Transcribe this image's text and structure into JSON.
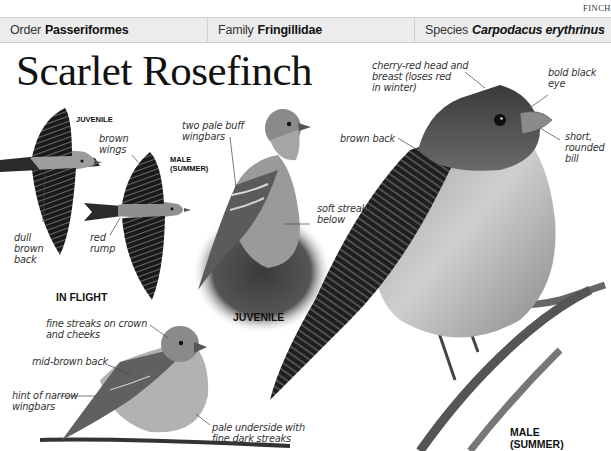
{
  "page": {
    "section_tag": "FINCH",
    "title": "Scarlet Rosefinch"
  },
  "taxonomy": {
    "order": {
      "label": "Order",
      "value": "Passeriformes"
    },
    "family": {
      "label": "Family",
      "value": "Fringillidae"
    },
    "species": {
      "label": "Species",
      "value": "Carpodacus erythrinus"
    }
  },
  "in_flight": {
    "caption": "IN FLIGHT",
    "juvenile_label": "JUVENILE",
    "male_label": "MALE\n(SUMMER)",
    "annotations": {
      "brown_wings": "brown\nwings",
      "dull_brown_back": "dull\nbrown\nback",
      "red_rump": "red\nrump"
    }
  },
  "juvenile": {
    "caption": "JUVENILE",
    "annotations": {
      "wingbars": "two pale buff\nwingbars",
      "soft_streaks": "soft streaks\nbelow"
    }
  },
  "female": {
    "annotations": {
      "fine_streaks": "fine streaks on crown\nand cheeks",
      "mid_brown_back": "mid-brown back",
      "narrow_wingbars": "hint of narrow\nwingbars",
      "pale_underside": "pale underside with\nfine dark streaks"
    }
  },
  "male_summer": {
    "caption": "MALE\n(SUMMER)",
    "annotations": {
      "head_breast": "cherry-red head and\nbreast (loses red\nin winter)",
      "eye": "bold black\neye",
      "bill": "short,\nrounded\nbill",
      "back": "brown back"
    }
  },
  "colors": {
    "header_bar": "#ececec",
    "divider": "#cfcfcf",
    "text": "#222222"
  }
}
